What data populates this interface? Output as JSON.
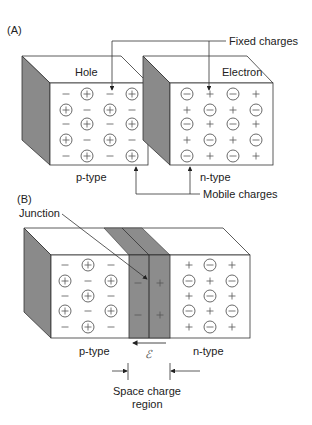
{
  "panel_a": {
    "label": "(A)",
    "left_block": {
      "title": "Hole",
      "type_label": "p-type",
      "rows": [
        [
          "-",
          "(+)",
          "-",
          "(+)"
        ],
        [
          "(+)",
          "-",
          "(+)",
          "-"
        ],
        [
          "-",
          "(+)",
          "-",
          "(+)"
        ],
        [
          "(+)",
          "-",
          "(+)",
          "-"
        ],
        [
          "-",
          "(+)",
          "-",
          "(+)"
        ]
      ]
    },
    "right_block": {
      "title": "Electron",
      "type_label": "n-type",
      "rows": [
        [
          "(-)",
          "+",
          "(-)",
          "+"
        ],
        [
          "+",
          "(-)",
          "+",
          "(-)"
        ],
        [
          "(-)",
          "+",
          "(-)",
          "+"
        ],
        [
          "+",
          "(-)",
          "+",
          "(-)"
        ],
        [
          "(-)",
          "+",
          "(-)",
          "+"
        ]
      ]
    },
    "annotations": {
      "fixed_charges": "Fixed charges",
      "mobile_charges": "Mobile charges"
    }
  },
  "panel_b": {
    "label": "(B)",
    "junction_label": "Junction",
    "p_region": {
      "type_label": "p-type",
      "rows": [
        [
          "-",
          "(+)",
          "-"
        ],
        [
          "(+)",
          "-",
          "(+)"
        ],
        [
          "-",
          "(+)",
          "-"
        ],
        [
          "(+)",
          "-",
          "(+)"
        ],
        [
          "-",
          "(+)",
          "-"
        ]
      ]
    },
    "depletion": {
      "left_charges": [
        "-",
        "-"
      ],
      "right_charges": [
        "+",
        "+"
      ],
      "field_symbol": "ℰ"
    },
    "n_region": {
      "type_label": "n-type",
      "rows": [
        [
          "+",
          "(-)",
          "+"
        ],
        [
          "(-)",
          "+",
          "(-)"
        ],
        [
          "+",
          "(-)",
          "+"
        ],
        [
          "(-)",
          "+",
          "(-)"
        ],
        [
          "+",
          "(-)",
          "+"
        ]
      ]
    },
    "space_charge_label_line1": "Space charge",
    "space_charge_label_line2": "region"
  },
  "colors": {
    "line": "#333333",
    "side_shade": "#8a8a8a",
    "depletion_shade": "#8c8c8c",
    "text": "#222222"
  }
}
